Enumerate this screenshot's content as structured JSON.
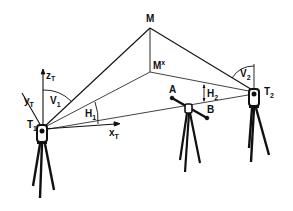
{
  "diagram": {
    "type": "surveying-intersection-geometry",
    "colors": {
      "ink": "#111111",
      "background": "#ffffff"
    },
    "points": {
      "M": {
        "label": "M",
        "x": 150,
        "y": 28
      },
      "M_star": {
        "label": "M",
        "sup": "x",
        "x": 150,
        "y": 72
      },
      "T1": {
        "label": "T",
        "sub": "1",
        "x": 42,
        "y": 130
      },
      "T2": {
        "label": "T",
        "sub": "2",
        "x": 255,
        "y": 93
      },
      "A": {
        "label": "A",
        "x": 172,
        "y": 98
      },
      "B": {
        "label": "B",
        "x": 208,
        "y": 120
      }
    },
    "axes": {
      "z": {
        "label": "z",
        "sub": "T"
      },
      "y": {
        "label": "y",
        "sub": "T"
      },
      "x": {
        "label": "x",
        "sub": "T"
      }
    },
    "angles": {
      "V1": {
        "label": "V",
        "sub": "1"
      },
      "H1": {
        "label": "H",
        "sub": "1"
      },
      "V2": {
        "label": "V",
        "sub": "2"
      },
      "H2": {
        "label": "H",
        "sub": "2"
      }
    },
    "instruments": [
      "theodolite-T1",
      "reference-bar-AB",
      "theodolite-T2"
    ]
  }
}
